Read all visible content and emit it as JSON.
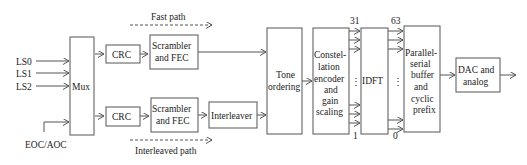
{
  "diagram": {
    "inputs": [
      "LS0",
      "LS1",
      "LS2"
    ],
    "side_input": "EOC/AOC",
    "mux": "Mux",
    "fast_path": {
      "label": "Fast path",
      "crc": "CRC",
      "scrambler_l1": "Scrambler",
      "scrambler_l2": "and FEC"
    },
    "interleaved_path": {
      "label": "Interleaved path",
      "crc": "CRC",
      "scrambler_l1": "Scrambler",
      "scrambler_l2": "and FEC",
      "interleaver": "Interleaver"
    },
    "tone_ordering": [
      "Tone",
      "ordering"
    ],
    "constellation": [
      "Constel-",
      "lation",
      "encoder",
      "and",
      "gain",
      "scaling"
    ],
    "idft": "IDFT",
    "parallel_serial": [
      "Parallel-",
      "serial",
      "buffer",
      "and",
      "cyclic",
      "prefix"
    ],
    "dac": [
      "DAC and",
      "analog"
    ],
    "idft_in_top": "31",
    "idft_in_bottom": "1",
    "idft_out_top": "63",
    "idft_out_bottom": "0",
    "ellipsis": "⋮"
  }
}
